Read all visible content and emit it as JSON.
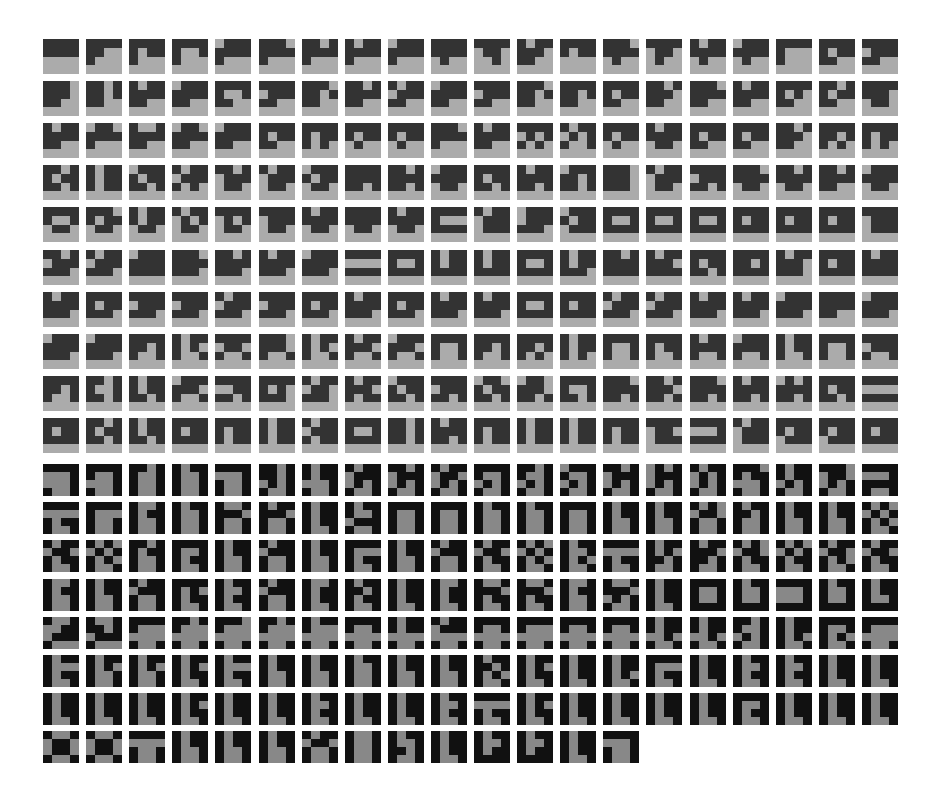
{
  "sheet": {
    "colors": {
      "top_dark": "#333333",
      "top_light": "#ababab",
      "bottom_dark": "#111111",
      "bottom_light": "#888888",
      "background": "#ffffff"
    },
    "grid": {
      "cols": 20,
      "x0": 43,
      "pitch_x": 43.1,
      "top_y0": 39,
      "top_pitch_y": 42.1,
      "bot_y0": 464,
      "bot_pitch_y": 38.2
    },
    "top_rows": [
      [
        "1111111100000000",
        "1111110010000000",
        "1111101110000000",
        "1111100110000000",
        "0111111110000000",
        "1110111110000000",
        "1101111110000000",
        "1011111110000000",
        "0111111110000000",
        "1111111101000000",
        "1111011000100000",
        "1011111011000000",
        "1111101100000000",
        "1110111101000000",
        "1111011001000000",
        "1011111101000000",
        "0111111101000000",
        "1111100010000000",
        "1111101111000000",
        "1111011111000000"
      ],
      [
        "1110111011000000",
        "1101110111000000",
        "1011111111000000",
        "0111111111000000",
        "1111100111000000",
        "1111011111000000",
        "1110110111000000",
        "1101111111000000",
        "1011011111000000",
        "0111111111000000",
        "1111011111000000",
        "1110110111000000",
        "1111110111000000",
        "1111101111000000",
        "1101111011000000",
        "1110111111000000",
        "1011111111000000",
        "1111101011000000",
        "1101101111000000",
        "1111111001100000"
      ],
      [
        "1011111111000000",
        "0110111110000000",
        "1001111111000000",
        "0110111111000000",
        "0111111111000000",
        "1111101111000000",
        "1111101110100000",
        "1111101101000000",
        "1111101101000000",
        "1110111110000000",
        "1011111111000000",
        "1111010110100000",
        "1011010110010000",
        "1111101101000000",
        "1011111101100000",
        "1111101111000000",
        "1111101111000000",
        "1101111011000000",
        "1111110110100000",
        "1111101110100000"
      ],
      [
        "1101101111010000",
        "1011101110110000",
        "0111101111010000",
        "1011011110100000",
        "1101011101100000",
        "1011011101100000",
        "0111101101100000",
        "1111111111010000",
        "1101111111010000",
        "0111111101100000",
        "1111101111010000",
        "1011111111010000",
        "0111110111010000",
        "1110111011100000",
        "1011011101100000",
        "1111011111010000",
        "1110111101100000",
        "1101111101100000",
        "1101111111000000",
        "0111111101100000"
      ],
      [
        "1111100101100000",
        "1110101101100000",
        "1011101101100000",
        "1011010101100000",
        "1111010101100000",
        "1111011101100000",
        "1011111101100000",
        "1111111101100000",
        "1011111101100000",
        "1111100011110000",
        "1011011101110000",
        "0111011111100000",
        "0111101101110000",
        "1111100111110000",
        "1111100111110000",
        "1111100111110000",
        "1111101111110000",
        "1111101111110000",
        "1111101111110000",
        "1111011101110000"
      ],
      [
        "1101011111100000",
        "1011011111100000",
        "0111111111110000",
        "1110111111100000",
        "1101111111100000",
        "1011111111100000",
        "0111111111100000",
        "1111000011110000",
        "1111100111110000",
        "1011101111110000",
        "1011101111110000",
        "1111100111110000",
        "1011101111100000",
        "1101111111110000",
        "1011111011110000",
        "1111101111010000",
        "1111110111110000",
        "1011111011100000",
        "1111101111110000",
        "1011111111110000"
      ],
      [
        "1011111111100000",
        "1111101111100000",
        "1111011111100000",
        "1111011111100000",
        "1011011111100000",
        "1111011111100000",
        "1111101111100000",
        "1011111111100000",
        "1111101111100000",
        "1011111111100000",
        "1011111111100000",
        "1111100111110000",
        "1111101111110000",
        "1011011111100000",
        "1011011111100000",
        "1011111111100000",
        "1011111111100000",
        "0111111111100000",
        "1111111111000000",
        "0111111111100000"
      ],
      [
        "0111111111100000",
        "0111111111100000",
        "1111110110010000",
        "1011101010010000",
        "1111011010010000",
        "1110111010010000",
        "1011101010010000",
        "1011111010010000",
        "0111111010010000",
        "1111100110010000",
        "1111110110010000",
        "1111110110100000",
        "1011101110100000",
        "1111100110010000",
        "1111101110010000",
        "1011111110010000",
        "0111111110010000",
        "1011101110010000",
        "1111100110010000",
        "1111011110010000"
      ],
      [
        "1111110110010000",
        "1101100111010000",
        "1011101111010000",
        "0111111010010000",
        "1111001111010000",
        "1111101011100000",
        "1011011011100000",
        "1011111010110000",
        "0111101111010000",
        "1111011111010000",
        "0110101111010000",
        "0110111011010000",
        "1111100111010000",
        "1110111111010000",
        "1101111011010000",
        "1110111111010000",
        "1011111111010000",
        "0101111111010000",
        "1111101111010000",
        "1111000011110000"
      ],
      [
        "1111101111110000",
        "1101101111010000",
        "1011101111010000",
        "1111101111110000",
        "1111101110110000",
        "1011101110110000",
        "1011011110110000",
        "1111100111110000",
        "1101110111010000",
        "1011111111010000",
        "1111101110110000",
        "1011101110110000",
        "1011101110110000",
        "1111101110110000",
        "1111011001110000",
        "1111000111110000",
        "1011011101110000",
        "1111101101110000",
        "1111101101110000",
        "1111101111110000"
      ]
    ],
    "bottom_rows": [
      [
        "1111000100011001",
        "1111100100011001",
        "1101100110011001",
        "1011100110011001",
        "1111000110011001",
        "1101110101011001",
        "1011101100011001",
        "1011011101011001",
        "1101011101011001",
        "1011011001011001",
        "1111100101011001",
        "1101100101011001",
        "0111100101011001",
        "1101011101011001",
        "0101011101011001",
        "1011010101011001",
        "1110101100011001",
        "1011101101011001",
        "1110011001011001",
        "1111000111111001"
      ],
      [
        "1111000010111001",
        "1111100010011001",
        "1001101110011001",
        "1011100110011001",
        "1001111010011001",
        "1011111010011001",
        "1011101110111001",
        "1011100101111001",
        "1111100110011001",
        "1111100110011001",
        "1011100110011001",
        "1011100110011001",
        "1111100110011001",
        "1011101110011001",
        "1011101110011001",
        "1010011010011001",
        "1011110110011001",
        "1011101110011001",
        "1011101110011001",
        "1010010110101001"
      ],
      [
        "1011011010111001",
        "1010010110101001",
        "1101101110011001",
        "1111100110111001",
        "1011101110011001",
        "1011011110011001",
        "1011101110011001",
        "1111100010111001",
        "1011101110011001",
        "1011011110011001",
        "1011011010111001",
        "1010010110101001",
        "1011100110101001",
        "1111000010111001",
        "1011101011011001",
        "1011111011011001",
        "1010011010111001",
        "1010010110111001",
        "1011011010101001",
        "1011011010111001"
      ],
      [
        "1001101110011001",
        "1011101110011001",
        "1011011110011001",
        "1111101010111001",
        "1011100110111001",
        "1011011110011001",
        "1001101110111001",
        "1011110110111001",
        "1011101110111001",
        "1001101110111001",
        "1001111010111001",
        "1001111010111001",
        "1001101110011001",
        "1001111001011001",
        "1011101110111001",
        "1111100110011111",
        "1011100110011111",
        "1111000100011111",
        "1011100110011111",
        "1011101110011111"
      ],
      [
        "1001001101111000",
        "1001110101111000",
        "1111100000001001",
        "1101100000001001",
        "1110100000001001",
        "1101100000001001",
        "1011100000001001",
        "1111100100001001",
        "1011101100001001",
        "1011011100001001",
        "1111100100001001",
        "1111100000001001",
        "1111100100001001",
        "1111100100001001",
        "1011101100101001",
        "1011101100101001",
        "1101100101011001",
        "1011101110101001",
        "1111100110101001",
        "1111100000001001"
      ],
      [
        "1011100010111001",
        "1011101010011001",
        "1011101010011001",
        "1011101010111001",
        "1011100010111001",
        "1011101110011001",
        "1011101110011001",
        "1011100110011001",
        "1011101110011001",
        "1011101110011001",
        "1011110110101001",
        "1011101010111001",
        "1011101110111001",
        "1011101110101001",
        "1111100010111001",
        "1011101110111001",
        "1011100110111001",
        "1011100110111001",
        "1011101110111001",
        "1011101110111001"
      ],
      [
        "1011101110111001",
        "1011101110111001",
        "1011101110111001",
        "1011101010111001",
        "1011101110111001",
        "1011101110111001",
        "1011100110111001",
        "1011101110111001",
        "1011101110111001",
        "1011100110111001",
        "1111000010111001",
        "1011101010111001",
        "1011101110111001",
        "1011101110111001",
        "1011101110111001",
        "1011101110111001",
        "1111100110111001",
        "1011101110111001",
        "1011101110111001",
        "1011101110111001"
      ],
      [
        "1001011001101001",
        "1001011001101001",
        "1111000010011001",
        "1011101110011001",
        "1011101110011001",
        "1011101110011001",
        "1011011010011001",
        "1001100110011001",
        "1011100111011001",
        "1011101110111001",
        "1011100110111111",
        "1011100110111111",
        "1011101110111001",
        "1111000110011001"
      ]
    ]
  }
}
